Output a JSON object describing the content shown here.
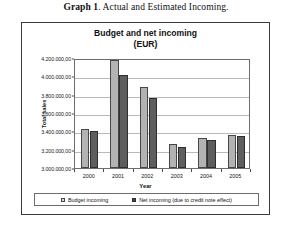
{
  "figure": {
    "caption_label": "Graph 1",
    "caption_text": ". Actual and Estimated Incoming."
  },
  "chart_data": {
    "type": "bar",
    "title": "Budget and net incoming\n(EUR)",
    "xlabel": "Year",
    "ylabel": "Total sales",
    "categories": [
      "2000",
      "2001",
      "2002",
      "2003",
      "2004",
      "2005"
    ],
    "series": [
      {
        "name": "Budget incoming",
        "color": "#b3b3b3",
        "values": [
          3430000,
          4180000,
          3880000,
          3265000,
          3330000,
          3355000
        ]
      },
      {
        "name": "Net incoming (due to credit note effect)",
        "color": "#5e5e5e",
        "values": [
          3400000,
          4010000,
          3760000,
          3230000,
          3310000,
          3345000
        ]
      }
    ],
    "ylim": [
      3000000,
      4200000
    ],
    "ytick_values": [
      3000000,
      3200000,
      3400000,
      3600000,
      3800000,
      4000000,
      4200000
    ],
    "ytick_labels": [
      "3.000.000,00",
      "3.200.000,00",
      "3.400.000,00",
      "3.600.000,00",
      "3.800.000,00",
      "4.000.000,00",
      "4.200.000,00"
    ],
    "grid": true,
    "legend_position": "bottom"
  }
}
